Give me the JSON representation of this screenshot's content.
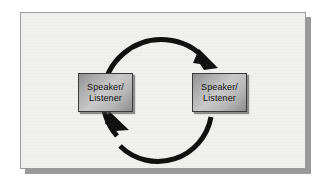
{
  "figure": {
    "description": "Two identical Speaker/Listener boxes connected by a circular two-way arrow loop",
    "panel": {
      "background_color": "#f0f0ef",
      "border_color": "#9b9b9b",
      "shadow_color": "#9a9a9a"
    }
  },
  "nodes": [
    {
      "id": "speaker-listener-left",
      "lines": [
        "Speaker/",
        "Listener"
      ],
      "fill_light": "#c8c8c8",
      "fill_dark": "#8e8e8e",
      "border_color": "#3a3a3a",
      "text_color": "#121212"
    },
    {
      "id": "speaker-listener-right",
      "lines": [
        "Speaker/",
        "Listener"
      ],
      "fill_light": "#c8c8c8",
      "fill_dark": "#8e8e8e",
      "border_color": "#3a3a3a",
      "text_color": "#121212"
    }
  ],
  "arrows": [
    {
      "id": "top-arc-left-to-right",
      "direction": "clockwise",
      "from": "speaker-listener-left",
      "to": "speaker-listener-right",
      "color": "#111111",
      "stroke_width": 5
    },
    {
      "id": "bottom-arc-right-to-left",
      "direction": "clockwise",
      "from": "speaker-listener-right",
      "to": "speaker-listener-left",
      "color": "#111111",
      "stroke_width": 5
    }
  ],
  "geometry": {
    "circle_center_x": 141,
    "circle_center_y": 80,
    "circle_radius": 54
  }
}
